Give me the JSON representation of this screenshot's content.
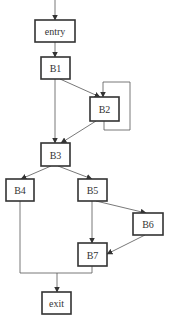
{
  "diagram": {
    "type": "control-flow-graph",
    "nodes": [
      {
        "id": "entry",
        "label": "entry"
      },
      {
        "id": "B1",
        "label": "B1"
      },
      {
        "id": "B2",
        "label": "B2"
      },
      {
        "id": "B3",
        "label": "B3"
      },
      {
        "id": "B4",
        "label": "B4"
      },
      {
        "id": "B5",
        "label": "B5"
      },
      {
        "id": "B6",
        "label": "B6"
      },
      {
        "id": "B7",
        "label": "B7"
      },
      {
        "id": "exit",
        "label": "exit"
      }
    ],
    "edges": [
      {
        "from": "start",
        "to": "entry"
      },
      {
        "from": "entry",
        "to": "B1"
      },
      {
        "from": "B1",
        "to": "B2"
      },
      {
        "from": "B1",
        "to": "B3"
      },
      {
        "from": "B2",
        "to": "B2"
      },
      {
        "from": "B2",
        "to": "B3"
      },
      {
        "from": "B3",
        "to": "B4"
      },
      {
        "from": "B3",
        "to": "B5"
      },
      {
        "from": "B5",
        "to": "B6"
      },
      {
        "from": "B5",
        "to": "B7"
      },
      {
        "from": "B6",
        "to": "B7"
      },
      {
        "from": "B4",
        "to": "exit"
      },
      {
        "from": "B7",
        "to": "exit"
      }
    ]
  },
  "labels": {
    "entry": "entry",
    "B1": "B1",
    "B2": "B2",
    "B3": "B3",
    "B4": "B4",
    "B5": "B5",
    "B6": "B6",
    "B7": "B7",
    "exit": "exit"
  }
}
